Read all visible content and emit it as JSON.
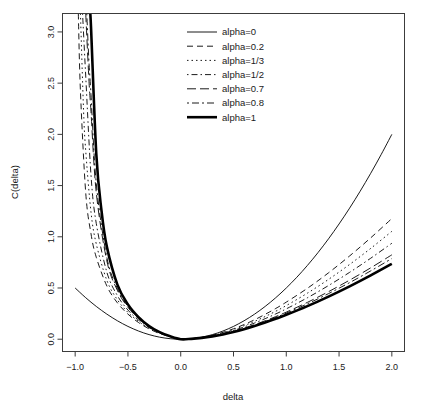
{
  "chart_data": {
    "type": "line",
    "title": "",
    "xlabel": "delta",
    "ylabel": "C(delta)",
    "xlim": [
      -1.12,
      2.12
    ],
    "ylim": [
      -0.12,
      3.18
    ],
    "xticks": [
      -1.0,
      -0.5,
      0.0,
      0.5,
      1.0,
      1.5,
      2.0
    ],
    "xticklabels": [
      "-1.0",
      "-0.5",
      "0.0",
      "0.5",
      "1.0",
      "1.5",
      "2.0"
    ],
    "yticks": [
      0.0,
      0.5,
      1.0,
      1.5,
      2.0,
      2.5,
      3.0
    ],
    "yticklabels": [
      "0.0",
      "0.5",
      "1.0",
      "1.5",
      "2.0",
      "2.5",
      "3.0"
    ],
    "grid": false,
    "legend_position": "top-center",
    "legend_entries": [
      {
        "label": "alpha=0",
        "alpha": 0,
        "linestyle": "solid",
        "dasharray": "",
        "linewidth": 0.9
      },
      {
        "label": "alpha=0.2",
        "alpha": 0.2,
        "linestyle": "dashed",
        "dasharray": "6,4",
        "linewidth": 0.9
      },
      {
        "label": "alpha=1/3",
        "alpha": 0.3333,
        "linestyle": "dotted",
        "dasharray": "1.5,3",
        "linewidth": 0.9
      },
      {
        "label": "alpha=1/2",
        "alpha": 0.5,
        "linestyle": "dashdot",
        "dasharray": "1.5,3,6,3",
        "linewidth": 0.9
      },
      {
        "label": "alpha=0.7",
        "alpha": 0.7,
        "linestyle": "longdash",
        "dasharray": "9,4",
        "linewidth": 0.9
      },
      {
        "label": "alpha=0.8",
        "alpha": 0.8,
        "linestyle": "twodash",
        "dasharray": "2,3,7,3",
        "linewidth": 0.9
      },
      {
        "label": "alpha=1",
        "alpha": 1,
        "linestyle": "solid",
        "dasharray": "",
        "linewidth": 2.6
      }
    ],
    "series": [
      {
        "name": "alpha=0",
        "x": [
          -1.0,
          -0.9,
          -0.8,
          -0.7,
          -0.6,
          -0.5,
          -0.4,
          -0.3,
          -0.2,
          -0.1,
          0.0,
          0.1,
          0.2,
          0.3,
          0.4,
          0.5,
          0.6,
          0.7,
          0.8,
          0.9,
          1.0,
          1.1,
          1.2,
          1.3,
          1.4,
          1.5,
          1.6,
          1.7,
          1.8,
          1.9,
          2.0
        ],
        "y": [
          0.5,
          0.405,
          0.32,
          0.245,
          0.18,
          0.125,
          0.08,
          0.045,
          0.02,
          0.005,
          0.0,
          0.005,
          0.02,
          0.045,
          0.08,
          0.125,
          0.18,
          0.245,
          0.32,
          0.405,
          0.5,
          0.605,
          0.72,
          0.845,
          0.98,
          1.125,
          1.28,
          1.445,
          1.62,
          1.805,
          2.0
        ]
      },
      {
        "name": "alpha=0.2",
        "x": [
          -0.97,
          -0.95,
          -0.9,
          -0.85,
          -0.8,
          -0.7,
          -0.6,
          -0.5,
          -0.4,
          -0.3,
          -0.2,
          -0.1,
          0.0,
          0.1,
          0.2,
          0.3,
          0.4,
          0.5,
          0.6,
          0.7,
          0.8,
          0.9,
          1.0,
          1.2,
          1.4,
          1.6,
          1.8,
          2.0
        ],
        "y": [
          3.18,
          2.42,
          1.43,
          1.03,
          0.8,
          0.52,
          0.355,
          0.245,
          0.163,
          0.101,
          0.056,
          0.024,
          0.0,
          0.0045,
          0.0175,
          0.0385,
          0.067,
          0.102,
          0.143,
          0.19,
          0.243,
          0.3,
          0.362,
          0.497,
          0.648,
          0.813,
          0.99,
          1.178
        ]
      },
      {
        "name": "alpha=1/3",
        "x": [
          -0.95,
          -0.92,
          -0.9,
          -0.85,
          -0.8,
          -0.7,
          -0.6,
          -0.5,
          -0.4,
          -0.3,
          -0.2,
          -0.1,
          0.0,
          0.1,
          0.2,
          0.3,
          0.4,
          0.5,
          0.6,
          0.7,
          0.8,
          0.9,
          1.0,
          1.2,
          1.4,
          1.6,
          1.8,
          2.0
        ],
        "y": [
          3.18,
          2.22,
          1.84,
          1.24,
          0.93,
          0.575,
          0.385,
          0.262,
          0.174,
          0.107,
          0.059,
          0.025,
          0.0,
          0.0042,
          0.0163,
          0.0358,
          0.062,
          0.0942,
          0.1318,
          0.1743,
          0.2215,
          0.2729,
          0.3283,
          0.4495,
          0.5839,
          0.73,
          0.8867,
          1.0532
        ]
      },
      {
        "name": "alpha=1/2",
        "x": [
          -0.93,
          -0.9,
          -0.85,
          -0.8,
          -0.7,
          -0.6,
          -0.5,
          -0.4,
          -0.3,
          -0.2,
          -0.1,
          0.0,
          0.1,
          0.2,
          0.3,
          0.4,
          0.5,
          0.6,
          0.7,
          0.8,
          0.9,
          1.0,
          1.2,
          1.4,
          1.6,
          1.8,
          2.0
        ],
        "y": [
          3.18,
          2.57,
          1.6,
          1.13,
          0.655,
          0.426,
          0.285,
          0.187,
          0.114,
          0.062,
          0.026,
          0.0,
          0.0039,
          0.015,
          0.0327,
          0.0565,
          0.0858,
          0.1199,
          0.1583,
          0.2007,
          0.2468,
          0.2963,
          0.4046,
          0.5238,
          0.6528,
          0.7907,
          0.9369
        ]
      },
      {
        "name": "alpha=0.7",
        "x": [
          -0.9,
          -0.87,
          -0.85,
          -0.8,
          -0.7,
          -0.6,
          -0.5,
          -0.4,
          -0.3,
          -0.2,
          -0.1,
          0.0,
          0.1,
          0.2,
          0.3,
          0.4,
          0.5,
          0.6,
          0.7,
          0.8,
          0.9,
          1.0,
          1.2,
          1.4,
          1.6,
          1.8,
          2.0
        ],
        "y": [
          3.18,
          2.54,
          2.22,
          1.43,
          0.765,
          0.477,
          0.311,
          0.201,
          0.121,
          0.065,
          0.027,
          0.0,
          0.0036,
          0.0138,
          0.0299,
          0.0513,
          0.0776,
          0.1081,
          0.1424,
          0.1801,
          0.2209,
          0.2645,
          0.3597,
          0.4641,
          0.5767,
          0.6968,
          0.8238
        ]
      },
      {
        "name": "alpha=0.8",
        "x": [
          -0.89,
          -0.87,
          -0.85,
          -0.8,
          -0.7,
          -0.6,
          -0.5,
          -0.4,
          -0.3,
          -0.2,
          -0.1,
          0.0,
          0.1,
          0.2,
          0.3,
          0.4,
          0.5,
          0.6,
          0.7,
          0.8,
          0.9,
          1.0,
          1.2,
          1.4,
          1.6,
          1.8,
          2.0
        ],
        "y": [
          3.18,
          2.72,
          2.39,
          1.52,
          0.8,
          0.494,
          0.32,
          0.206,
          0.124,
          0.066,
          0.0275,
          0.0,
          0.0035,
          0.0134,
          0.029,
          0.0497,
          0.0751,
          0.1045,
          0.1374,
          0.1736,
          0.2127,
          0.2545,
          0.3455,
          0.4452,
          0.5525,
          0.667,
          0.7879
        ]
      },
      {
        "name": "alpha=1",
        "x": [
          -0.86,
          -0.85,
          -0.8,
          -0.75,
          -0.7,
          -0.6,
          -0.5,
          -0.4,
          -0.3,
          -0.2,
          -0.1,
          0.0,
          0.1,
          0.2,
          0.3,
          0.4,
          0.5,
          0.6,
          0.7,
          0.8,
          0.9,
          1.0,
          1.2,
          1.4,
          1.6,
          1.8,
          2.0
        ],
        "y": [
          3.18,
          3.05,
          1.81,
          1.25,
          0.904,
          0.533,
          0.34,
          0.216,
          0.129,
          0.0686,
          0.0281,
          0.0,
          0.0034,
          0.0127,
          0.0274,
          0.0467,
          0.0704,
          0.0978,
          0.1286,
          0.1625,
          0.199,
          0.2381,
          0.323,
          0.4161,
          0.5162,
          0.6232,
          0.7363
        ]
      }
    ]
  },
  "figure": {
    "background": "#ffffff",
    "foreground": "#000000",
    "frame_color": "#3c3c3c"
  }
}
